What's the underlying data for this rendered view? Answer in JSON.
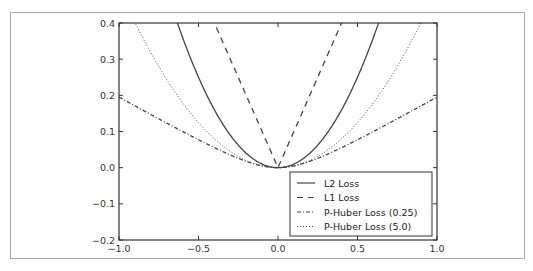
{
  "chart_data": {
    "type": "line",
    "title": "",
    "xlabel": "",
    "ylabel": "",
    "xlim": [
      -1.0,
      1.0
    ],
    "ylim": [
      -0.2,
      0.4
    ],
    "x_ticks": [
      "-1.0",
      "-0.5",
      "0.0",
      "0.5",
      "1.0"
    ],
    "y_ticks": [
      "0.4",
      "0.3",
      "0.2",
      "0.1",
      "0.0",
      "-0.1",
      "-0.2"
    ],
    "grid": false,
    "legend_position": "lower right",
    "x": [
      -1.0,
      -0.9,
      -0.8,
      -0.7,
      -0.632,
      -0.6,
      -0.5,
      -0.4,
      -0.3,
      -0.2,
      -0.1,
      0.0,
      0.1,
      0.2,
      0.3,
      0.4,
      0.5,
      0.6,
      0.632,
      0.7,
      0.8,
      0.9,
      1.0
    ],
    "series": [
      {
        "name": "L2 Loss",
        "style": "solid",
        "formula": "x^2",
        "values": [
          1.0,
          0.81,
          0.64,
          0.49,
          0.4,
          0.36,
          0.25,
          0.16,
          0.09,
          0.04,
          0.01,
          0.0,
          0.01,
          0.04,
          0.09,
          0.16,
          0.25,
          0.36,
          0.4,
          0.49,
          0.64,
          0.81,
          1.0
        ]
      },
      {
        "name": "L1 Loss",
        "style": "dashed",
        "formula": "|x|",
        "values": [
          1.0,
          0.9,
          0.8,
          0.7,
          0.632,
          0.6,
          0.5,
          0.4,
          0.3,
          0.2,
          0.1,
          0.0,
          0.1,
          0.2,
          0.3,
          0.4,
          0.5,
          0.6,
          0.632,
          0.7,
          0.8,
          0.9,
          1.0
        ]
      },
      {
        "name": "P-Huber Loss (0.25)",
        "style": "dashdot",
        "formula": "0.25^2*(sqrt(1+(x/0.25)^2)-1)",
        "values": [
          0.195,
          0.171,
          0.147,
          0.124,
          0.108,
          0.102,
          0.077,
          0.055,
          0.035,
          0.018,
          0.005,
          0.0,
          0.005,
          0.018,
          0.035,
          0.055,
          0.077,
          0.102,
          0.108,
          0.124,
          0.147,
          0.171,
          0.195
        ]
      },
      {
        "name": "P-Huber Loss (5.0)",
        "style": "dotted",
        "formula": "5^2*(sqrt(1+(x/5)^2)-1)",
        "values": [
          0.495,
          0.402,
          0.318,
          0.244,
          0.199,
          0.179,
          0.125,
          0.08,
          0.045,
          0.02,
          0.005,
          0.0,
          0.005,
          0.02,
          0.045,
          0.08,
          0.125,
          0.179,
          0.199,
          0.244,
          0.318,
          0.402,
          0.495
        ]
      }
    ],
    "legend": [
      "L2 Loss",
      "L1 Loss",
      "P-Huber Loss (0.25)",
      "P-Huber Loss (5.0)"
    ]
  },
  "plot": {
    "left": 119,
    "right": 437,
    "top": 23,
    "bottom": 240,
    "line_color": "#444444"
  }
}
